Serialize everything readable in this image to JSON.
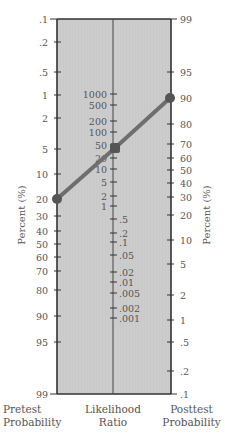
{
  "chart_data": {
    "type": "nomogram",
    "axes": {
      "left": {
        "title": "Percent (%)",
        "label": "Pretest Probability",
        "ticks": [
          ".1",
          ".2",
          ".5",
          "1",
          "2",
          "5",
          "10",
          "20",
          "30",
          "40",
          "50",
          "60",
          "70",
          "80",
          "90",
          "95",
          "99"
        ],
        "tick_y": [
          19,
          42,
          72,
          95,
          118,
          149,
          174,
          199,
          216,
          231,
          244,
          257,
          271,
          290,
          316,
          342,
          394
        ]
      },
      "center": {
        "label": "Likelihood Ratio",
        "ticks_upper": [
          "1000",
          "500",
          "200",
          "100",
          "50",
          "20",
          "10",
          "5",
          "2",
          "1"
        ],
        "ticks_upper_y": [
          94,
          105,
          121,
          132,
          145,
          158,
          169,
          182,
          196,
          206
        ],
        "ticks_lower": [
          ".5",
          ".2",
          ".1",
          ".05",
          ".02",
          ".01",
          ".005",
          ".002",
          ".001"
        ],
        "ticks_lower_y": [
          219,
          233,
          242,
          255,
          272,
          282,
          293,
          308,
          318
        ]
      },
      "right": {
        "title": "Percent (%)",
        "label": "Posttest Probability",
        "ticks": [
          "99",
          "95",
          "90",
          "80",
          "70",
          "60",
          "50",
          "40",
          "30",
          "20",
          "10",
          "5",
          "2",
          "1",
          ".5",
          ".2",
          ".1"
        ],
        "tick_y": [
          19,
          72,
          98,
          124,
          144,
          158,
          170,
          183,
          197,
          215,
          240,
          264,
          295,
          320,
          342,
          371,
          394
        ]
      }
    },
    "line": {
      "pretest_probability": 20,
      "likelihood_ratio": 40,
      "posttest_probability": 90,
      "points": [
        [
          57,
          199
        ],
        [
          115,
          148
        ],
        [
          170,
          98
        ]
      ]
    },
    "colors": {
      "background_band": "#c9c9c9",
      "axis": "#333333",
      "line": "#6e6e6e",
      "marker": "#555555"
    }
  },
  "labels": {
    "left_bottom_line1": "Pretest",
    "left_bottom_line2": "Probability",
    "center_bottom_line1": "Likelihood",
    "center_bottom_line2": "Ratio",
    "right_bottom_line1": "Posttest",
    "right_bottom_line2": "Probability",
    "left_title": "Percent (%)",
    "right_title": "Percent (%)"
  }
}
